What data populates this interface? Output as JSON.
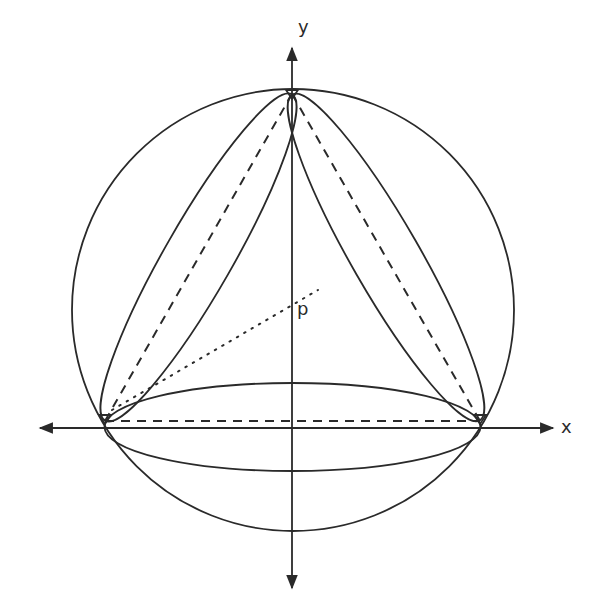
{
  "diagram": {
    "axes": {
      "x_label": "x",
      "y_label": "y",
      "origin_px": [
        292,
        428
      ]
    },
    "circle": {
      "center_px": [
        293,
        310
      ],
      "radius_px": 221
    },
    "triangle_vertices_px": {
      "top": [
        292,
        94
      ],
      "left": [
        105,
        421
      ],
      "right": [
        480,
        421
      ]
    },
    "lenses": [
      {
        "name": "left-edge-lens",
        "from": "left",
        "to": "top"
      },
      {
        "name": "right-edge-lens",
        "from": "top",
        "to": "right"
      },
      {
        "name": "bottom-edge-lens",
        "from": "left",
        "to": "right"
      }
    ],
    "dashed_edges": [
      "left-top",
      "top-right",
      "left-right"
    ],
    "dotted_segment": {
      "label": "p",
      "from_px": [
        140,
        395
      ],
      "to_px": [
        318,
        290
      ]
    },
    "point_label": "p",
    "colors": {
      "stroke": "#2a2a2a",
      "background": "#ffffff"
    }
  }
}
